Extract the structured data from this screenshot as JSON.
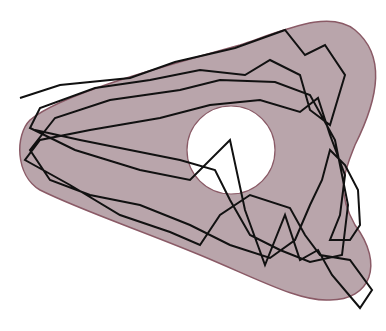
{
  "figure": {
    "colors": {
      "background": "#ffffff",
      "region_fill": "#b9a5ab",
      "region_stroke": "#8a5a66",
      "hole_fill": "#ffffff",
      "path_stroke": "#111111"
    },
    "region": {
      "path": "M 30 120 C 60 95, 150 70, 240 45 C 290 28, 330 10, 355 30 C 385 55, 380 95, 355 145 C 345 170, 335 190, 355 225 C 385 265, 370 300, 330 300 C 300 302, 260 280, 200 255 C 140 230, 80 210, 40 190 C 15 175, 15 135, 30 120 Z"
    },
    "hole": {
      "cx": 231,
      "cy": 150,
      "r": 44
    },
    "polyline": "20,98 60,85 130,78 175,62 235,48 285,30 305,55 325,45 345,75 330,125 310,110 300,75 270,60 245,75 200,70 150,80 95,88 40,108 30,128 75,150 140,170 190,180 230,140 245,210 265,265 285,215 300,260 318,250 332,275 360,308 372,290 350,260 320,255 305,235 290,208 250,195 220,215 200,245 170,232 120,215 70,185 25,160 40,140 90,130 160,118 210,105 260,100 300,112 318,98 330,135 345,175 340,215 330,240 350,240 360,225 358,190 345,165 330,150 322,180 310,205 295,240 270,258 230,245 190,225 140,205 90,195 50,180 30,150 55,118 110,100 180,90 220,80 275,82 310,95 335,140 348,205 342,255 310,262 280,250 250,235 230,200 215,170 180,160 130,150 80,140 35,130"
  }
}
